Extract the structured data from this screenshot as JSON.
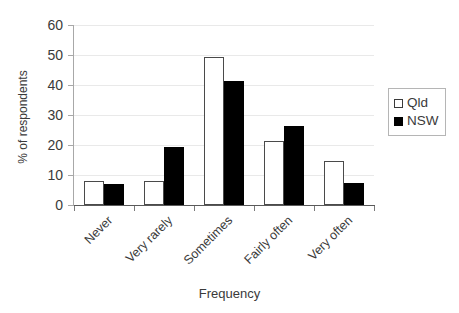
{
  "chart_data": {
    "type": "bar",
    "title": "",
    "xlabel": "Frequency",
    "ylabel": "% of respondents",
    "categories": [
      "Never",
      "Very rarely",
      "Sometimes",
      "Fairly often",
      "Very often"
    ],
    "series": [
      {
        "name": "Qld",
        "color": "#ffffff",
        "values": [
          8.0,
          8.1,
          49.5,
          21.5,
          14.7
        ]
      },
      {
        "name": "NSW",
        "color": "#000000",
        "values": [
          7.0,
          19.3,
          41.3,
          26.5,
          7.5
        ]
      }
    ],
    "ylim": [
      0,
      60
    ],
    "yticks": [
      0,
      10,
      20,
      30,
      40,
      50,
      60
    ],
    "ytick_labels": [
      "0",
      "10",
      "20",
      "30",
      "40",
      "50",
      "60"
    ],
    "grid": "horizontal",
    "legend_position": "right"
  },
  "legend": {
    "entries": [
      {
        "label": "Qld",
        "swatch": "open-square-swatch"
      },
      {
        "label": "NSW",
        "swatch": "filled-square-swatch"
      }
    ]
  }
}
